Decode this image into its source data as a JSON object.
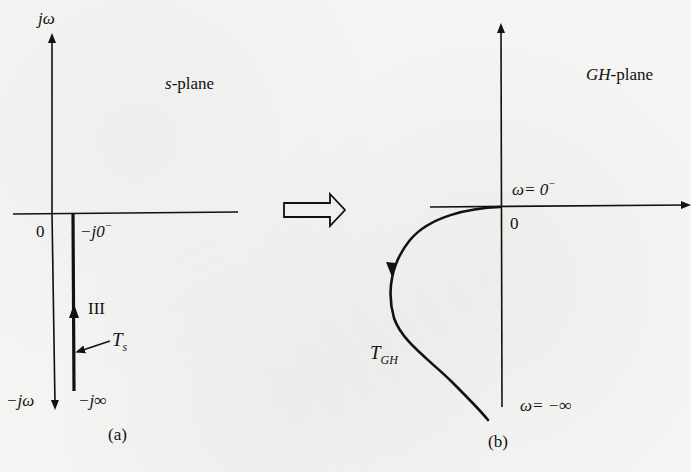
{
  "figure": {
    "panel_a": {
      "caption": "(a)",
      "plane_label_italic": "s",
      "plane_label_rest": "-plane",
      "vertical_axis_top_label": "jω",
      "vertical_axis_bottom_label": "−jω",
      "origin_label": "0",
      "contour_start_label_main": "−j0",
      "contour_start_label_sup": "−",
      "contour_end_label": "−j∞",
      "segment_label": "III",
      "contour_label_main": "T",
      "contour_label_sub": "s"
    },
    "mapping_arrow": "hollow-right-arrow",
    "panel_b": {
      "caption": "(b)",
      "plane_label_italic": "GH",
      "plane_label_rest": "-plane",
      "origin_label": "0",
      "start_label_main": "ω= 0",
      "start_label_sup": "−",
      "end_label": "ω= −∞",
      "contour_label_main": "T",
      "contour_label_sub": "GH"
    },
    "colors": {
      "ink": "#111111",
      "paper": "#f4f4f2"
    }
  }
}
